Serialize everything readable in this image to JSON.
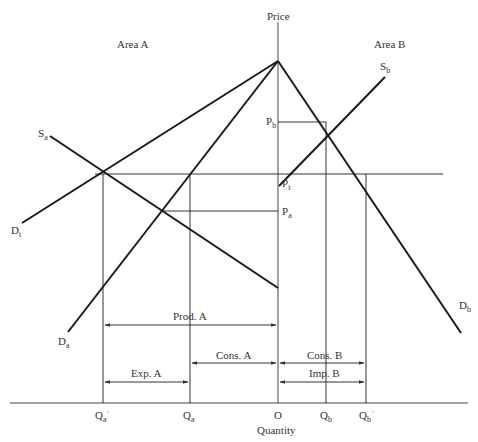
{
  "diagram": {
    "type": "two-area trade equilibrium (supply/demand)",
    "area_labels": {
      "left": "Area A",
      "right": "Area B"
    },
    "axes": {
      "y_label": "Price",
      "x_label": "Quantity"
    },
    "price_labels": {
      "pb": {
        "main": "P",
        "sub": "b"
      },
      "pt": {
        "main": "P",
        "sub": "t"
      },
      "pa": {
        "main": "P",
        "sub": "a"
      }
    },
    "curve_labels": {
      "sa": {
        "main": "S",
        "sub": "a"
      },
      "sb": {
        "main": "S",
        "sub": "b"
      },
      "dt": {
        "main": "D",
        "sub": "t"
      },
      "da": {
        "main": "D",
        "sub": "a"
      },
      "db": {
        "main": "D",
        "sub": "b"
      }
    },
    "quantity_labels": {
      "qa_prime": {
        "main": "Q",
        "sub": "a",
        "prime": "'"
      },
      "qa": {
        "main": "Q",
        "sub": "a"
      },
      "origin": "O",
      "qb": {
        "main": "Q",
        "sub": "b"
      },
      "qb_prime": {
        "main": "Q",
        "sub": "b",
        "prime": "'"
      }
    },
    "bracket_labels": {
      "prod_a": "Prod. A",
      "cons_a": "Cons. A",
      "exp_a": "Exp. A",
      "cons_b": "Cons. B",
      "imp_b": "Imp. B"
    },
    "colors": {
      "line": "#1a1a1a",
      "thin": "#333333",
      "background": "#ffffff"
    }
  }
}
